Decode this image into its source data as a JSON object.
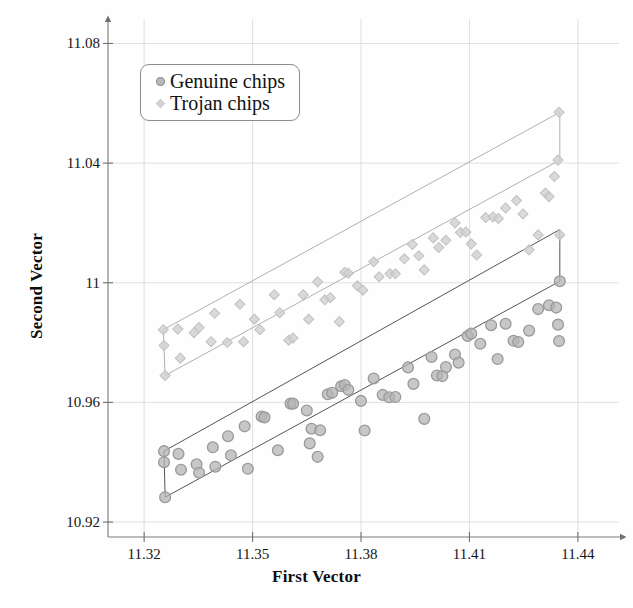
{
  "chart_data": {
    "type": "scatter",
    "title": "",
    "xlabel": "First Vector",
    "ylabel": "Second Vector",
    "xlim": [
      11.31,
      11.4475
    ],
    "ylim": [
      10.915,
      11.0835
    ],
    "xticks": [
      "11.32",
      "11.35",
      "11.38",
      "11.41",
      "11.44"
    ],
    "xtick_values": [
      11.32,
      11.35,
      11.38,
      11.41,
      11.44
    ],
    "yticks": [
      "10.92",
      "10.96",
      "11",
      "11.04",
      "11.08"
    ],
    "ytick_values": [
      10.92,
      10.96,
      11.0,
      11.04,
      11.08
    ],
    "grid": true,
    "legend_position": "top-left-inside",
    "series": [
      {
        "name": "Genuine chips",
        "marker": "circle",
        "color": "#9a9a9a",
        "fill": "#b4b4b4",
        "points": [
          [
            11.3255,
            10.9437
          ],
          [
            11.3255,
            10.94
          ],
          [
            11.3258,
            10.9283
          ],
          [
            11.3295,
            10.9428
          ],
          [
            11.3302,
            10.9375
          ],
          [
            11.3345,
            10.9393
          ],
          [
            11.3352,
            10.9365
          ],
          [
            11.339,
            10.945
          ],
          [
            11.3397,
            10.9385
          ],
          [
            11.3432,
            10.9487
          ],
          [
            11.344,
            10.9423
          ],
          [
            11.3478,
            10.952
          ],
          [
            11.3487,
            10.9378
          ],
          [
            11.3525,
            10.9553
          ],
          [
            11.3533,
            10.955
          ],
          [
            11.357,
            10.944
          ],
          [
            11.3605,
            10.9596
          ],
          [
            11.3612,
            10.9596
          ],
          [
            11.365,
            10.9573
          ],
          [
            11.3658,
            10.9463
          ],
          [
            11.3663,
            10.9512
          ],
          [
            11.368,
            10.9418
          ],
          [
            11.3687,
            10.9507
          ],
          [
            11.3708,
            10.9627
          ],
          [
            11.372,
            10.9632
          ],
          [
            11.3745,
            10.9654
          ],
          [
            11.3755,
            10.9658
          ],
          [
            11.3765,
            10.9642
          ],
          [
            11.38,
            10.9605
          ],
          [
            11.381,
            10.9506
          ],
          [
            11.3835,
            10.968
          ],
          [
            11.386,
            10.9625
          ],
          [
            11.3878,
            10.9617
          ],
          [
            11.3895,
            10.9618
          ],
          [
            11.393,
            10.9717
          ],
          [
            11.3945,
            10.9662
          ],
          [
            11.3975,
            10.9545
          ],
          [
            11.3995,
            10.9752
          ],
          [
            11.401,
            10.969
          ],
          [
            11.4025,
            10.9688
          ],
          [
            11.4035,
            10.9718
          ],
          [
            11.406,
            10.976
          ],
          [
            11.407,
            10.9733
          ],
          [
            11.4095,
            10.9822
          ],
          [
            11.4105,
            10.983
          ],
          [
            11.413,
            10.9796
          ],
          [
            11.416,
            10.9858
          ],
          [
            11.4178,
            10.9745
          ],
          [
            11.42,
            10.9863
          ],
          [
            11.4222,
            10.9806
          ],
          [
            11.4235,
            10.9802
          ],
          [
            11.4265,
            10.984
          ],
          [
            11.429,
            10.9912
          ],
          [
            11.432,
            10.9925
          ],
          [
            11.434,
            10.9917
          ],
          [
            11.4345,
            10.986
          ],
          [
            11.4348,
            10.9805
          ],
          [
            11.435,
            11.0005
          ]
        ]
      },
      {
        "name": "Trojan chips",
        "marker": "diamond",
        "color": "#c3c3c3",
        "fill": "#cfcfcf",
        "points": [
          [
            11.3253,
            10.9843
          ],
          [
            11.3255,
            10.979
          ],
          [
            11.3258,
            10.969
          ],
          [
            11.3293,
            10.9845
          ],
          [
            11.33,
            10.9748
          ],
          [
            11.3338,
            10.9833
          ],
          [
            11.3352,
            10.985
          ],
          [
            11.3385,
            10.9803
          ],
          [
            11.3395,
            10.9898
          ],
          [
            11.343,
            10.98
          ],
          [
            11.3465,
            10.9928
          ],
          [
            11.3475,
            10.9803
          ],
          [
            11.3505,
            10.9878
          ],
          [
            11.352,
            10.9843
          ],
          [
            11.356,
            10.996
          ],
          [
            11.3575,
            10.99
          ],
          [
            11.36,
            10.9808
          ],
          [
            11.3612,
            10.9815
          ],
          [
            11.364,
            10.996
          ],
          [
            11.3655,
            10.9878
          ],
          [
            11.368,
            11.0003
          ],
          [
            11.37,
            10.9943
          ],
          [
            11.3715,
            10.995
          ],
          [
            11.374,
            10.987
          ],
          [
            11.3755,
            11.0035
          ],
          [
            11.3765,
            11.0032
          ],
          [
            11.379,
            10.999
          ],
          [
            11.3805,
            10.9975
          ],
          [
            11.3835,
            11.007
          ],
          [
            11.385,
            11.002
          ],
          [
            11.388,
            11.003
          ],
          [
            11.3895,
            11.003
          ],
          [
            11.392,
            11.008
          ],
          [
            11.3942,
            11.0128
          ],
          [
            11.396,
            11.009
          ],
          [
            11.3975,
            11.0043
          ],
          [
            11.4,
            11.015
          ],
          [
            11.4015,
            11.0118
          ],
          [
            11.4035,
            11.0142
          ],
          [
            11.406,
            11.02
          ],
          [
            11.4075,
            11.0168
          ],
          [
            11.409,
            11.017
          ],
          [
            11.4105,
            11.013
          ],
          [
            11.412,
            11.0093
          ],
          [
            11.4145,
            11.0218
          ],
          [
            11.4165,
            11.022
          ],
          [
            11.418,
            11.0215
          ],
          [
            11.42,
            11.025
          ],
          [
            11.423,
            11.0275
          ],
          [
            11.4248,
            11.023
          ],
          [
            11.4265,
            11.011
          ],
          [
            11.429,
            11.016
          ],
          [
            11.431,
            11.03
          ],
          [
            11.432,
            11.0288
          ],
          [
            11.4335,
            11.0355
          ],
          [
            11.4345,
            11.041
          ],
          [
            11.4348,
            11.057
          ],
          [
            11.435,
            11.016
          ]
        ]
      }
    ],
    "hulls": [
      {
        "name": "genuine-band",
        "color": "#555555",
        "vertices": [
          [
            11.3258,
            10.9283
          ],
          [
            11.435,
            11.0005
          ],
          [
            11.435,
            11.0178
          ],
          [
            11.3255,
            10.9437
          ]
        ]
      },
      {
        "name": "trojan-band",
        "color": "#b0b0b0",
        "vertices": [
          [
            11.3258,
            10.969
          ],
          [
            11.435,
            11.041
          ],
          [
            11.435,
            11.057
          ],
          [
            11.3253,
            10.9843
          ]
        ]
      }
    ]
  },
  "legend": {
    "items": [
      {
        "label": "Genuine chips",
        "marker": "circle"
      },
      {
        "label": "Trojan chips",
        "marker": "diamond"
      }
    ]
  },
  "axes": {
    "x_title": "First Vector",
    "y_title": "Second Vector"
  },
  "colors": {
    "genuine_stroke": "#9a9a9a",
    "genuine_fill": "#b4b4b4",
    "trojan_stroke": "#c3c3c3",
    "trojan_fill": "#cfcfcf",
    "grid": "#d8d8d8",
    "axis": "#7a7a7a",
    "genuine_hull": "#555555",
    "trojan_hull": "#b0b0b0"
  }
}
